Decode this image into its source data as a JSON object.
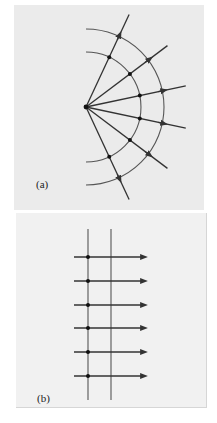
{
  "panels": [
    {
      "id": "a",
      "label": "(a)",
      "description": "Spherical wavefronts (arcs) emanating from a point source with radial rays",
      "source": {
        "x": 86,
        "y": 107
      },
      "wavefront_radii": [
        55,
        78
      ],
      "ray_angles_deg": [
        -65,
        -37,
        -12,
        12,
        37,
        65
      ],
      "ray_length": 102
    },
    {
      "id": "b",
      "label": "(b)",
      "description": "Plane wavefronts (parallel lines) with parallel rays",
      "wavefront_x": [
        88,
        111
      ],
      "ray_y": [
        257,
        281,
        305,
        328,
        352,
        376
      ],
      "ray_x_start": 74,
      "ray_x_end": 144
    }
  ],
  "colors": {
    "line": "#333333",
    "wavefront": "#555555",
    "background_a": "#ebebeb",
    "background_b": "#f1f1f1"
  }
}
